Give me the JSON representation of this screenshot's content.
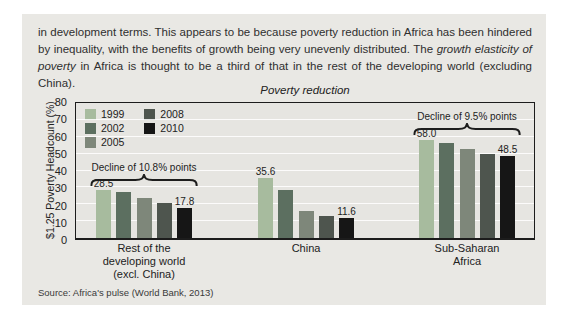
{
  "paragraph": {
    "before": "in development terms. This appears to be because poverty reduction in Africa has been hindered by inequality, with the benefits of growth being very unevenly distributed. The ",
    "italic": "growth elasticity of poverty",
    "after": " in Africa is thought to be a third of that in the rest of the developing world (excluding China)."
  },
  "chart_data": {
    "type": "bar",
    "title": "Poverty reduction",
    "ylabel": "$1.25 Poverty Headcount (%)",
    "ylim": [
      0,
      80
    ],
    "yticks": [
      0,
      10,
      20,
      30,
      40,
      50,
      60,
      70,
      80
    ],
    "grid": "horizontal, every 10, light lines on gray plot background",
    "legend_position": "top-left inside plot, two columns",
    "series": [
      {
        "name": "1999",
        "color": "#a7bb9e"
      },
      {
        "name": "2002",
        "color": "#5c6f60"
      },
      {
        "name": "2005",
        "color": "#7e877a"
      },
      {
        "name": "2008",
        "color": "#4e554e"
      },
      {
        "name": "2010",
        "color": "#161616"
      }
    ],
    "groups": [
      {
        "label_lines": [
          "Rest of the",
          "developing world",
          "(excl. China)"
        ],
        "values": [
          28.5,
          27.0,
          23.5,
          20.5,
          17.8
        ],
        "first_label": "28.5",
        "last_label": "17.8",
        "annotation": "Decline of 10.8% points"
      },
      {
        "label_lines": [
          "China"
        ],
        "values": [
          35.6,
          28.4,
          16.3,
          13.1,
          11.6
        ],
        "first_label": "35.6",
        "last_label": "11.6",
        "annotation": null
      },
      {
        "label_lines": [
          "Sub-Saharan",
          "Africa"
        ],
        "values": [
          58.0,
          56.5,
          53.0,
          50.0,
          48.5
        ],
        "first_label": "58.0",
        "last_label": "48.5",
        "annotation": "Decline of 9.5% points"
      }
    ]
  },
  "source": "Source: Africa's pulse (World Bank, 2013)"
}
